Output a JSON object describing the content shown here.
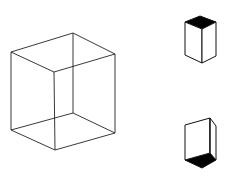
{
  "diagram": {
    "stroke_color": "#222222",
    "fill_color": "#000000",
    "background": "#ffffff",
    "figures": [
      {
        "id": "necker-cube",
        "kind": "wireframe-cube",
        "description": "Ambiguous Necker cube wireframe"
      },
      {
        "id": "cube-viewed-from-above",
        "kind": "shaded-cube",
        "shaded_face": "top"
      },
      {
        "id": "cube-viewed-from-below",
        "kind": "shaded-cube",
        "shaded_face": "bottom"
      }
    ]
  }
}
